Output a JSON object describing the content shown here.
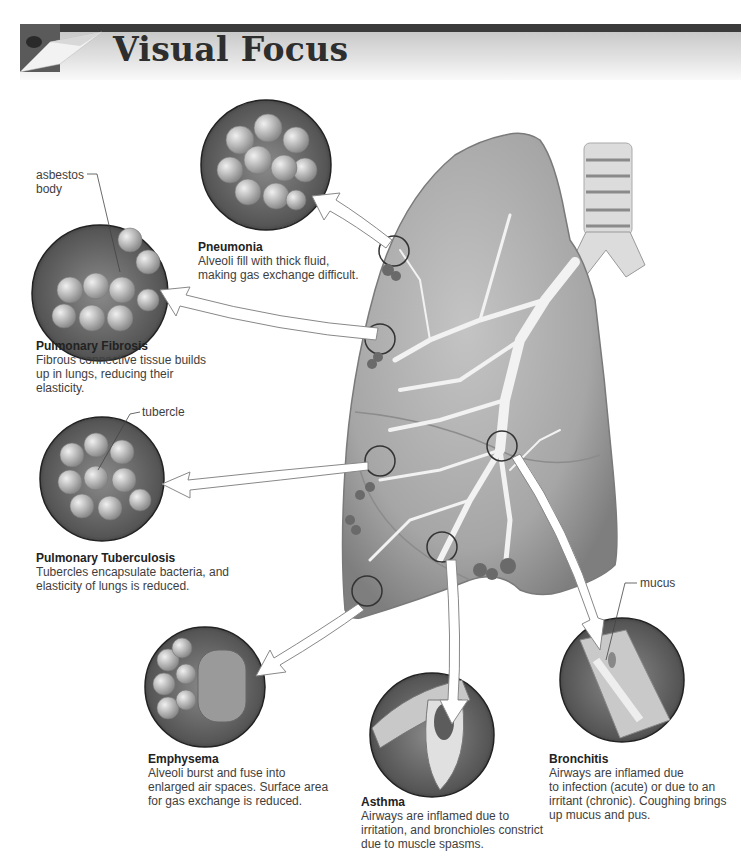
{
  "header": {
    "title": "Visual Focus"
  },
  "diagram": {
    "subject": "lung",
    "colors": {
      "header_bar": "#3b3b3b",
      "lung_fill": "#a8a8a8",
      "circle_fill": "#6a6a6a",
      "text": "#3e3e3e"
    },
    "callouts": {
      "asbestos": [
        "asbestos",
        "body"
      ],
      "tubercle": "tubercle",
      "mucus": "mucus"
    },
    "conditions": [
      {
        "id": "pneumonia",
        "title": "Pneumonia",
        "lines": [
          "Alveoli fill with thick fluid,",
          "making gas exchange difficult."
        ]
      },
      {
        "id": "pulmonary-fibrosis",
        "title": "Pulmonary Fibrosis",
        "lines": [
          "Fibrous connective tissue builds",
          "up in lungs, reducing their",
          "elasticity."
        ]
      },
      {
        "id": "pulmonary-tuberculosis",
        "title": "Pulmonary Tuberculosis",
        "lines": [
          "Tubercles encapsulate bacteria, and",
          "elasticity of lungs is reduced."
        ]
      },
      {
        "id": "emphysema",
        "title": "Emphysema",
        "lines": [
          "Alveoli burst and fuse into",
          "enlarged air spaces. Surface area",
          "for gas exchange is reduced."
        ]
      },
      {
        "id": "asthma",
        "title": "Asthma",
        "lines": [
          "Airways are inflamed due to",
          "irritation, and bronchioles constrict",
          "due to muscle spasms."
        ]
      },
      {
        "id": "bronchitis",
        "title": "Bronchitis",
        "lines": [
          "Airways are inflamed due",
          "to infection (acute) or due to an",
          "irritant (chronic). Coughing brings",
          "up mucus and pus."
        ]
      }
    ]
  }
}
